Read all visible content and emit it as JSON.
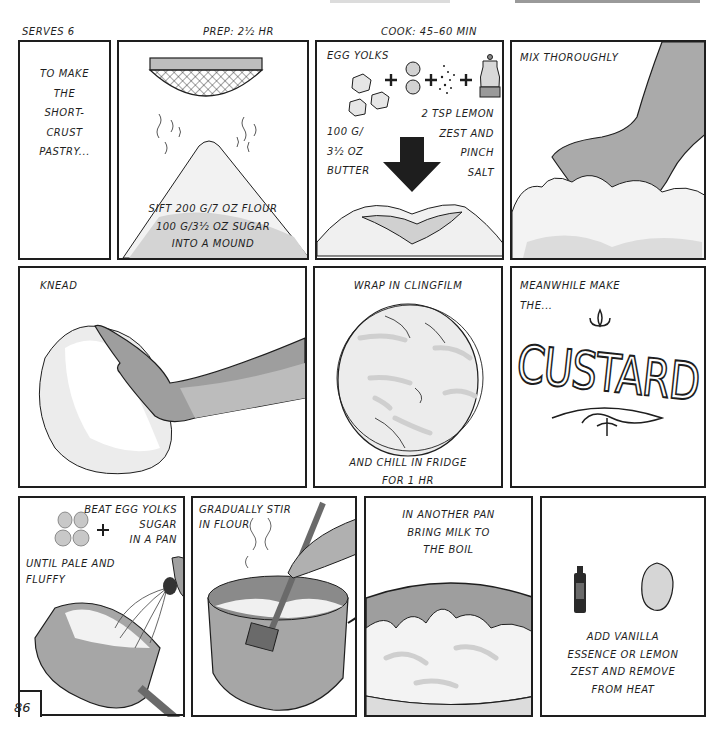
{
  "header": {
    "serves": "SERVES 6",
    "prep": "PREP: 2½ HR",
    "cook": "COOK: 45–60 MIN"
  },
  "page_number": "86",
  "colors": {
    "ink": "#1e1e1e",
    "mid_gray": "#9a9a9a",
    "light_gray": "#cfcfcf",
    "paper": "#ffffff"
  },
  "panels": [
    {
      "id": "intro",
      "lines": [
        "TO MAKE",
        "THE",
        "SHORT-",
        "CRUST",
        "PASTRY..."
      ]
    },
    {
      "id": "sift",
      "lines": [
        "SIFT 200 G/7 OZ FLOUR",
        "100 G/3½ OZ SUGAR",
        "INTO A MOUND"
      ]
    },
    {
      "id": "add-ingredients",
      "title": "EGG YOLKS",
      "butter_lines": [
        "100 G/",
        "3½ OZ",
        "BUTTER"
      ],
      "lemon_lines": [
        "2 TSP LEMON",
        "ZEST AND",
        "PINCH",
        "SALT"
      ]
    },
    {
      "id": "mix",
      "title": "MIX THOROUGHLY"
    },
    {
      "id": "knead",
      "title": "KNEAD"
    },
    {
      "id": "wrap",
      "title": "WRAP IN CLINGFILM",
      "lines": [
        "AND CHILL IN FRIDGE",
        "FOR 1 HR"
      ]
    },
    {
      "id": "custard-intro",
      "lines": [
        "MEANWHILE MAKE",
        "THE..."
      ],
      "word": "CUSTARD"
    },
    {
      "id": "beat",
      "title_lines": [
        "BEAT EGG YOLKS",
        "SUGAR",
        "IN A PAN"
      ],
      "lines": [
        "UNTIL PALE AND",
        "FLUFFY"
      ]
    },
    {
      "id": "stir",
      "lines": [
        "GRADUALLY STIR",
        "IN FLOUR"
      ]
    },
    {
      "id": "boil",
      "lines": [
        "IN ANOTHER PAN",
        "BRING MILK TO",
        "THE BOIL"
      ]
    },
    {
      "id": "flavour",
      "lines": [
        "ADD VANILLA",
        "ESSENCE OR LEMON",
        "ZEST AND REMOVE",
        "FROM HEAT"
      ]
    }
  ]
}
